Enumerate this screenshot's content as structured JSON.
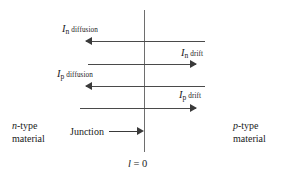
{
  "figure": {
    "type": "pn-junction-current-diagram",
    "background_color": "#ffffff",
    "line_color": "#4a4a4a",
    "text_color": "#1a1a1a"
  },
  "junction": {
    "axis_label": "l = 0",
    "axis_label_symbol": "l",
    "axis_label_rest": "= 0",
    "annotation_text": "Junction"
  },
  "regions": {
    "left": {
      "symbol": "n",
      "line1_rest": "-type",
      "line2": "material"
    },
    "right": {
      "symbol": "p",
      "line1_rest": "-type",
      "line2": "material"
    }
  },
  "currents": [
    {
      "id": "in-diffusion",
      "symbol": "I",
      "subscript": "n",
      "kind": "diffusion",
      "direction": "left"
    },
    {
      "id": "in-drift",
      "symbol": "I",
      "subscript": "n",
      "kind": "drift",
      "direction": "right"
    },
    {
      "id": "ip-diffusion",
      "symbol": "I",
      "subscript": "p",
      "kind": "diffusion",
      "direction": "left"
    },
    {
      "id": "ip-drift",
      "symbol": "I",
      "subscript": "p",
      "kind": "drift",
      "direction": "right"
    }
  ]
}
